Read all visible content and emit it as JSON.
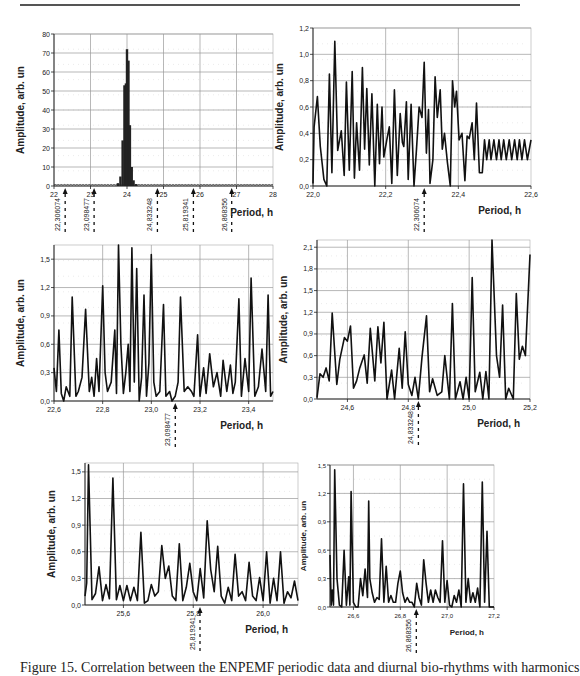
{
  "caption": "Figure 15. Correlation between the ENPEMF periodic data and diurnal bio-rhythms with harmonics",
  "chart_data": [
    {
      "id": "overview",
      "type": "bar",
      "title": "",
      "xlabel": "Period, h",
      "ylabel": "Amplitude, arb. un",
      "xlim": [
        22,
        28
      ],
      "ylim": [
        0,
        80
      ],
      "xticks": [
        22,
        23,
        24,
        25,
        26,
        27,
        28
      ],
      "xtick_labels": [
        "22",
        "23",
        "24",
        "25",
        "26",
        "27",
        "28"
      ],
      "yticks": [
        0,
        10,
        20,
        30,
        40,
        50,
        60,
        70,
        80
      ],
      "ytick_labels": [
        "0",
        "10",
        "20",
        "30",
        "40",
        "50",
        "60",
        "70",
        "80"
      ],
      "grid": true,
      "box": {
        "x": 54,
        "y": 34,
        "w": 219,
        "h": 152
      },
      "x": [
        23.75,
        23.82,
        23.88,
        23.93,
        23.97,
        24.0,
        24.04,
        24.08,
        24.13,
        24.18,
        24.25
      ],
      "values": [
        1.5,
        5,
        24,
        53,
        54,
        72,
        66,
        32,
        10,
        3,
        1
      ],
      "baseline_noise": 0.8,
      "markers": [
        {
          "x": 22.306074,
          "label": "22,306074"
        },
        {
          "x": 23.098477,
          "label": "23,098477"
        },
        {
          "x": 24.833248,
          "label": "24,833248"
        },
        {
          "x": 25.819341,
          "label": "25,819341"
        },
        {
          "x": 26.868356,
          "label": "26,868356"
        }
      ]
    },
    {
      "id": "zoom-22.0-22.6",
      "type": "line",
      "xlabel": "Period, h",
      "ylabel": "Amplitude, arb. un",
      "xlim": [
        22.0,
        22.6
      ],
      "ylim": [
        0,
        1.2
      ],
      "xticks": [
        22.0,
        22.2,
        22.4,
        22.6
      ],
      "xtick_labels": [
        "22,0",
        "22,2",
        "22,4",
        "22,6"
      ],
      "yticks": [
        0,
        0.2,
        0.4,
        0.6,
        0.8,
        1.0,
        1.2
      ],
      "ytick_labels": [
        "0,0",
        "0,2",
        "0,4",
        "0,6",
        "0,8",
        "1,0",
        "1,2"
      ],
      "grid": true,
      "box": {
        "x": 313,
        "y": 28,
        "w": 218,
        "h": 158
      },
      "x": [
        22.0,
        22.003,
        22.012,
        22.02,
        22.03,
        22.038,
        22.045,
        22.052,
        22.06,
        22.068,
        22.078,
        22.086,
        22.092,
        22.1,
        22.108,
        22.114,
        22.12,
        22.128,
        22.136,
        22.142,
        22.148,
        22.155,
        22.162,
        22.17,
        22.177,
        22.183,
        22.19,
        22.195,
        22.203,
        22.21,
        22.217,
        22.224,
        22.232,
        22.24,
        22.246,
        22.25,
        22.257,
        22.262,
        22.27,
        22.278,
        22.285,
        22.292,
        22.3,
        22.306,
        22.312,
        22.318,
        22.322,
        22.33,
        22.336,
        22.342,
        22.35,
        22.356,
        22.362,
        22.37,
        22.378,
        22.384,
        22.39,
        22.395,
        22.402,
        22.41,
        22.418,
        22.424,
        22.43,
        22.438,
        22.444,
        22.45,
        22.458,
        22.466,
        22.472,
        22.478,
        22.485,
        22.49,
        22.498,
        22.505,
        22.512,
        22.518,
        22.525,
        22.532,
        22.54,
        22.547,
        22.555,
        22.562,
        22.568,
        22.575,
        22.582,
        22.59,
        22.6
      ],
      "values": [
        0.02,
        0.45,
        0.68,
        0.3,
        0.05,
        0.0,
        0.85,
        0.1,
        1.1,
        0.27,
        0.42,
        0.08,
        0.79,
        0.12,
        0.87,
        0.06,
        0.48,
        0.12,
        0.9,
        0.28,
        0.74,
        0.16,
        0.7,
        0.0,
        0.62,
        0.17,
        0.6,
        0.22,
        0.35,
        0.45,
        0.02,
        0.73,
        0.08,
        0.55,
        0.33,
        0.3,
        0.64,
        0.05,
        0.62,
        0.0,
        0.28,
        0.6,
        0.52,
        0.94,
        0.25,
        0.58,
        0.02,
        0.2,
        0.83,
        0.52,
        0.73,
        0.28,
        0.4,
        0.18,
        0.0,
        0.8,
        0.6,
        0.72,
        0.35,
        0.4,
        0.04,
        0.38,
        0.36,
        0.48,
        0.2,
        0.63,
        0.1,
        0.1,
        0.35,
        0.2,
        0.35,
        0.2,
        0.35,
        0.2,
        0.35,
        0.2,
        0.35,
        0.2,
        0.35,
        0.2,
        0.35,
        0.2,
        0.35,
        0.2,
        0.35,
        0.2,
        0.35
      ],
      "markers": [
        {
          "x": 22.306074,
          "label": "22,306074"
        }
      ]
    },
    {
      "id": "zoom-22.6-23.5",
      "type": "line",
      "xlabel": "Period, h",
      "ylabel": "Amplitude, arb. un",
      "xlim": [
        22.6,
        23.5
      ],
      "ylim": [
        0,
        1.65
      ],
      "xticks": [
        22.6,
        22.8,
        23.0,
        23.2,
        23.4
      ],
      "xtick_labels": [
        "22,6",
        "22,8",
        "23,0",
        "23,2",
        "23,4"
      ],
      "yticks": [
        0,
        0.3,
        0.6,
        0.9,
        1.2,
        1.5
      ],
      "ytick_labels": [
        "0,0",
        "0,3",
        "0,6",
        "0,9",
        "1,2",
        "1,5"
      ],
      "grid": true,
      "box": {
        "x": 54,
        "y": 245,
        "w": 219,
        "h": 156
      },
      "x": [
        22.6,
        22.61,
        22.62,
        22.63,
        22.64,
        22.65,
        22.665,
        22.675,
        22.69,
        22.7,
        22.715,
        22.73,
        22.745,
        22.755,
        22.765,
        22.775,
        22.785,
        22.8,
        22.81,
        22.82,
        22.835,
        22.85,
        22.857,
        22.865,
        22.875,
        22.885,
        22.895,
        22.905,
        22.912,
        22.92,
        22.93,
        22.94,
        22.95,
        22.96,
        22.97,
        22.98,
        22.99,
        23.0,
        23.01,
        23.02,
        23.035,
        23.05,
        23.06,
        23.075,
        23.085,
        23.098,
        23.11,
        23.12,
        23.135,
        23.15,
        23.165,
        23.175,
        23.19,
        23.2,
        23.215,
        23.225,
        23.24,
        23.255,
        23.27,
        23.285,
        23.295,
        23.31,
        23.325,
        23.335,
        23.345,
        23.36,
        23.37,
        23.385,
        23.4,
        23.41,
        23.425,
        23.44,
        23.455,
        23.47,
        23.48,
        23.49,
        23.5
      ],
      "values": [
        0.35,
        0.1,
        0.75,
        0.08,
        0.0,
        0.15,
        0.05,
        1.1,
        0.05,
        0.1,
        0.25,
        0.97,
        0.1,
        0.25,
        0.05,
        0.45,
        0.1,
        1.22,
        0.3,
        0.1,
        0.2,
        0.75,
        0.08,
        1.65,
        0.6,
        0.08,
        0.3,
        0.6,
        0.1,
        1.62,
        0.2,
        1.4,
        0.0,
        0.25,
        1.12,
        0.05,
        0.4,
        1.55,
        0.2,
        0.05,
        0.1,
        1.02,
        0.05,
        0.1,
        0.0,
        0.05,
        0.2,
        1.1,
        0.1,
        0.15,
        0.1,
        0.05,
        0.7,
        0.05,
        0.35,
        0.08,
        0.5,
        0.15,
        0.3,
        0.05,
        0.43,
        0.1,
        0.38,
        0.08,
        0.2,
        1.08,
        0.05,
        0.45,
        0.1,
        1.3,
        0.05,
        0.15,
        0.55,
        0.1,
        1.12,
        0.05,
        0.1
      ],
      "markers": [
        {
          "x": 23.098477,
          "label": "23,098477"
        }
      ]
    },
    {
      "id": "zoom-24.5-25.2",
      "type": "line",
      "xlabel": "Period, h",
      "ylabel": "Amplitude, arb. un",
      "xlim": [
        24.5,
        25.2
      ],
      "ylim": [
        0,
        2.2
      ],
      "xticks": [
        24.6,
        24.8,
        25.0,
        25.2
      ],
      "xtick_labels": [
        "24,6",
        "24,8",
        "25,0",
        "25,2"
      ],
      "yticks": [
        0,
        0.3,
        0.6,
        0.9,
        1.2,
        1.5,
        1.8,
        2.1
      ],
      "ytick_labels": [
        "0,0",
        "0,3",
        "0,6",
        "0,9",
        "1,2",
        "1,5",
        "1,8",
        "2,1"
      ],
      "grid": true,
      "box": {
        "x": 317,
        "y": 240,
        "w": 213,
        "h": 159
      },
      "x": [
        24.5,
        24.51,
        24.52,
        24.53,
        24.54,
        24.55,
        24.565,
        24.575,
        24.59,
        24.6,
        24.61,
        24.62,
        24.63,
        24.64,
        24.655,
        24.665,
        24.675,
        24.69,
        24.7,
        24.71,
        24.72,
        24.73,
        24.745,
        24.755,
        24.77,
        24.78,
        24.79,
        24.8,
        24.812,
        24.822,
        24.833,
        24.845,
        24.86,
        24.87,
        24.88,
        24.895,
        24.91,
        24.92,
        24.935,
        24.945,
        24.955,
        24.97,
        24.98,
        24.99,
        25.0,
        25.01,
        25.02,
        25.035,
        25.045,
        25.055,
        25.065,
        25.075,
        25.09,
        25.1,
        25.11,
        25.12,
        25.13,
        25.145,
        25.155,
        25.165,
        25.175,
        25.185,
        25.2
      ],
      "values": [
        0.02,
        0.35,
        0.3,
        0.43,
        0.25,
        1.19,
        0.2,
        0.55,
        0.85,
        0.8,
        1.01,
        0.15,
        0.25,
        0.42,
        0.61,
        0.22,
        0.98,
        0.25,
        1.0,
        0.5,
        1.06,
        0.0,
        0.4,
        0.0,
        0.7,
        0.15,
        0.93,
        0.2,
        0.05,
        0.3,
        0.0,
        0.58,
        1.15,
        0.1,
        0.28,
        0.05,
        0.1,
        0.6,
        0.0,
        1.32,
        0.0,
        0.24,
        0.0,
        0.3,
        0.0,
        1.68,
        0.1,
        0.37,
        0.0,
        0.38,
        0.0,
        2.2,
        0.6,
        0.3,
        1.3,
        0.0,
        0.15,
        0.0,
        1.46,
        0.55,
        0.73,
        0.6,
        2.0
      ],
      "markers": [
        {
          "x": 24.833248,
          "label": "24,833248"
        }
      ]
    },
    {
      "id": "zoom-25.5-26.1",
      "type": "line",
      "xlabel": "Period, h",
      "ylabel": "Amplitude, arb. un",
      "xlim": [
        25.49,
        26.1
      ],
      "ylim": [
        0,
        1.6
      ],
      "xticks": [
        25.6,
        25.8,
        26.0
      ],
      "xtick_labels": [
        "25,6",
        "25,8",
        "26,0"
      ],
      "yticks": [
        0,
        0.3,
        0.6,
        0.9,
        1.2,
        1.5
      ],
      "ytick_labels": [
        "0,0",
        "0,3",
        "0,6",
        "0,9",
        "1,2",
        "1,5"
      ],
      "grid": true,
      "box": {
        "x": 85,
        "y": 463,
        "w": 213,
        "h": 142
      },
      "x": [
        25.49,
        25.495,
        25.5,
        25.51,
        25.52,
        25.53,
        25.54,
        25.55,
        25.56,
        25.57,
        25.58,
        25.59,
        25.6,
        25.61,
        25.62,
        25.63,
        25.64,
        25.65,
        25.66,
        25.67,
        25.68,
        25.69,
        25.7,
        25.71,
        25.72,
        25.73,
        25.74,
        25.75,
        25.76,
        25.77,
        25.78,
        25.79,
        25.8,
        25.81,
        25.82,
        25.83,
        25.84,
        25.85,
        25.86,
        25.87,
        25.88,
        25.89,
        25.9,
        25.91,
        25.92,
        25.93,
        25.94,
        25.95,
        25.96,
        25.97,
        25.98,
        25.99,
        26.0,
        26.01,
        26.02,
        26.03,
        26.04,
        26.05,
        26.06,
        26.07,
        26.08,
        26.09,
        26.1
      ],
      "values": [
        0.1,
        0.25,
        1.58,
        0.06,
        0.13,
        0.43,
        0.05,
        0.23,
        0.07,
        1.43,
        0.06,
        0.22,
        0.05,
        0.22,
        0.05,
        0.2,
        0.05,
        0.82,
        0.02,
        0.05,
        0.23,
        0.1,
        0.15,
        0.67,
        0.3,
        0.44,
        0.1,
        0.05,
        0.69,
        0.05,
        0.2,
        0.47,
        0.15,
        0.05,
        0.41,
        0.08,
        0.95,
        0.4,
        0.15,
        0.66,
        0.1,
        0.02,
        0.2,
        0.05,
        0.57,
        0.1,
        0.15,
        0.05,
        0.48,
        0.1,
        0.05,
        0.31,
        0.05,
        0.6,
        0.02,
        0.3,
        0.05,
        0.6,
        0.02,
        0.15,
        0.08,
        0.27,
        0.05
      ],
      "markers": [
        {
          "x": 25.819341,
          "label": "25,819341"
        }
      ]
    },
    {
      "id": "zoom-26.5-27.2",
      "type": "line",
      "xlabel": "Period, h",
      "ylabel": "Amplitude, arb. un",
      "xlim": [
        26.5,
        27.2
      ],
      "ylim": [
        0,
        1.5
      ],
      "xticks": [
        26.6,
        26.8,
        27.0,
        27.2
      ],
      "xtick_labels": [
        "26,6",
        "26,8",
        "27,0",
        "27,2"
      ],
      "yticks": [
        0,
        0.3,
        0.6,
        0.9,
        1.2,
        1.5
      ],
      "ytick_labels": [
        "0,0",
        "0,3",
        "0,6",
        "0,9",
        "1,2",
        "1,5"
      ],
      "grid": true,
      "box": {
        "x": 330,
        "y": 465,
        "w": 164,
        "h": 142
      },
      "x": [
        26.5,
        26.505,
        26.51,
        26.515,
        26.52,
        26.53,
        26.54,
        26.55,
        26.56,
        26.57,
        26.58,
        26.585,
        26.59,
        26.6,
        26.61,
        26.62,
        26.63,
        26.64,
        26.65,
        26.66,
        26.665,
        26.67,
        26.68,
        26.69,
        26.7,
        26.71,
        26.72,
        26.73,
        26.74,
        26.75,
        26.76,
        26.77,
        26.78,
        26.79,
        26.8,
        26.81,
        26.82,
        26.83,
        26.84,
        26.85,
        26.86,
        26.87,
        26.88,
        26.89,
        26.9,
        26.91,
        26.92,
        26.93,
        26.94,
        26.95,
        26.96,
        26.97,
        26.98,
        26.99,
        27.0,
        27.01,
        27.02,
        27.03,
        27.04,
        27.05,
        27.06,
        27.07,
        27.08,
        27.09,
        27.1,
        27.11,
        27.12,
        27.13,
        27.14,
        27.15,
        27.16,
        27.17,
        27.18,
        27.19,
        27.2
      ],
      "values": [
        0.55,
        0.02,
        0.18,
        0.02,
        1.45,
        0.3,
        0.02,
        0.0,
        0.6,
        0.02,
        0.32,
        0.02,
        1.22,
        0.05,
        0.0,
        0.0,
        0.3,
        0.12,
        0.4,
        0.1,
        1.12,
        0.3,
        0.15,
        0.05,
        0.1,
        0.08,
        0.72,
        0.05,
        0.43,
        0.05,
        0.12,
        0.05,
        0.05,
        0.25,
        0.38,
        0.15,
        0.05,
        0.1,
        0.05,
        0.05,
        0.0,
        0.25,
        0.1,
        0.02,
        0.5,
        0.25,
        0.05,
        0.18,
        0.05,
        0.18,
        0.1,
        0.05,
        0.7,
        0.05,
        0.28,
        0.02,
        0.0,
        0.12,
        0.05,
        0.18,
        0.0,
        1.3,
        0.05,
        0.3,
        0.05,
        0.15,
        0.05,
        0.2,
        0.0,
        1.32,
        0.05,
        0.8,
        0.0,
        0.0,
        0.0
      ],
      "markers": [
        {
          "x": 26.868356,
          "label": "26,868356"
        }
      ]
    }
  ]
}
